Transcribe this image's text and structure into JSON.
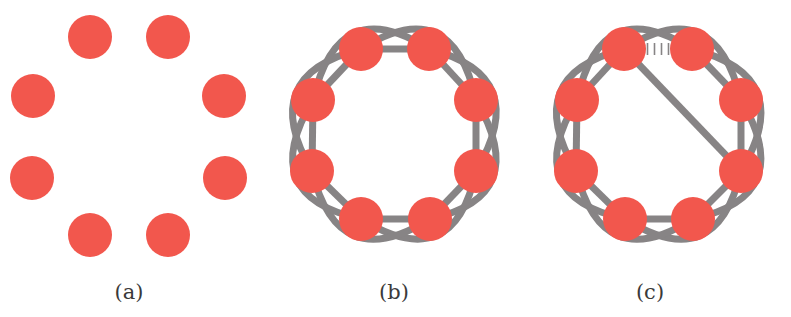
{
  "figure": {
    "colors": {
      "node": "#f2574d",
      "edge": "#878485",
      "label": "#3a3a3a",
      "background": "#ffffff"
    },
    "node_radius": 22,
    "edge_width": 7,
    "panels": [
      {
        "id": "a",
        "label": "(a)",
        "label_pos": [
          129,
          294
        ],
        "nodes": [
          [
            90,
            37
          ],
          [
            168,
            37
          ],
          [
            224,
            96
          ],
          [
            225,
            178
          ],
          [
            168,
            235
          ],
          [
            90,
            235
          ],
          [
            32,
            178
          ],
          [
            33,
            96
          ]
        ],
        "adjacent_edges": false,
        "skip_arcs": false,
        "broken_edge": null,
        "chord": null
      },
      {
        "id": "b",
        "label": "(b)",
        "label_pos": [
          394,
          294
        ],
        "nodes": [
          [
            361,
            49
          ],
          [
            429,
            49
          ],
          [
            476,
            100
          ],
          [
            476,
            171
          ],
          [
            430,
            219
          ],
          [
            361,
            219
          ],
          [
            312,
            171
          ],
          [
            313,
            100
          ]
        ],
        "adjacent_edges": true,
        "skip_arcs": true,
        "broken_edge": null,
        "chord": null
      },
      {
        "id": "c",
        "label": "(c)",
        "label_pos": [
          650,
          294
        ],
        "nodes": [
          [
            624,
            49
          ],
          [
            692,
            49
          ],
          [
            741,
            100
          ],
          [
            741,
            171
          ],
          [
            693,
            219
          ],
          [
            625,
            219
          ],
          [
            576,
            171
          ],
          [
            577,
            100
          ]
        ],
        "adjacent_edges": true,
        "skip_arcs": true,
        "broken_edge": [
          0,
          1
        ],
        "broken_edge_marker": "||||",
        "chord": [
          0,
          3
        ]
      }
    ]
  }
}
